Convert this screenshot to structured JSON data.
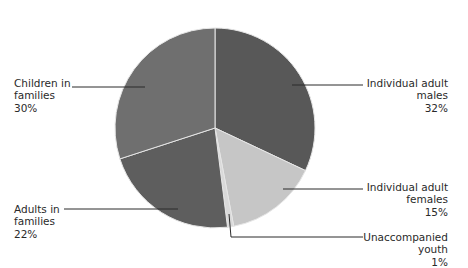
{
  "chart_data": {
    "type": "pie",
    "title": "",
    "start_angle_deg": 0,
    "direction": "clockwise",
    "center": [
      215,
      128
    ],
    "radius": 100,
    "slices": [
      {
        "name": "Individual adult males",
        "value": 32,
        "color": "#585858",
        "label_lines": [
          "Individual adult",
          "males",
          "32%"
        ],
        "label_pos": {
          "side": "right",
          "right": 20,
          "top": 77
        },
        "leader": [
          [
            292,
            85
          ],
          [
            363,
            85
          ]
        ]
      },
      {
        "name": "Individual adult females",
        "value": 15,
        "color": "#c6c6c6",
        "label_lines": [
          "Individual adult",
          "females",
          "15%"
        ],
        "label_pos": {
          "side": "right",
          "right": 20,
          "top": 181
        },
        "leader": [
          [
            283,
            189
          ],
          [
            363,
            189
          ]
        ]
      },
      {
        "name": "Unaccompanied youth",
        "value": 1,
        "color": "#d9d9d9",
        "label_lines": [
          "Unaccompanied",
          "youth",
          "1%"
        ],
        "label_pos": {
          "side": "right",
          "right": 20,
          "top": 231
        },
        "leader": [
          [
            229,
            214
          ],
          [
            231,
            237
          ],
          [
            363,
            237
          ]
        ]
      },
      {
        "name": "Adults in families",
        "value": 22,
        "color": "#5e5e5e",
        "label_lines": [
          "Adults in",
          "families",
          "22%"
        ],
        "label_pos": {
          "side": "left",
          "left": 14,
          "top": 203
        },
        "leader": [
          [
            64,
            209
          ],
          [
            178,
            209
          ]
        ]
      },
      {
        "name": "Children in families",
        "value": 30,
        "color": "#6f6f6f",
        "label_lines": [
          "Children in",
          "families",
          "30%"
        ],
        "label_pos": {
          "side": "left",
          "left": 14,
          "top": 77
        },
        "leader": [
          [
            72,
            87
          ],
          [
            145,
            87
          ]
        ]
      }
    ],
    "legend": "none (direct labels with leader lines)",
    "slice_border_color": "#e6e6e6"
  }
}
